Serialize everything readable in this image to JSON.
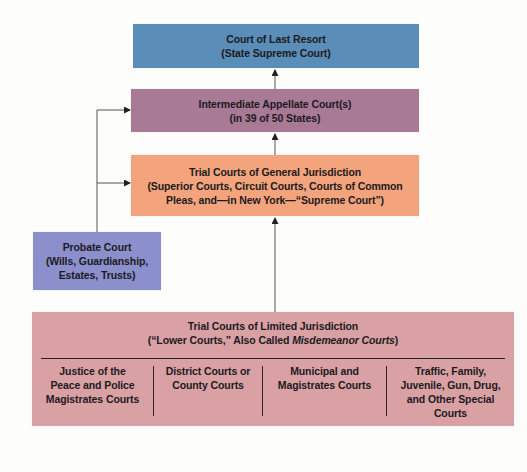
{
  "diagram": {
    "supreme": {
      "title": "Court of Last Resort",
      "subtitle": "(State Supreme Court)",
      "color": "#5b8db9"
    },
    "appellate": {
      "title": "Intermediate Appellate Court(s)",
      "subtitle": "(in 39 of 50 States)",
      "color": "#a97a95"
    },
    "general": {
      "title": "Trial Courts of General Jurisdiction",
      "line2": "(Superior Courts, Circuit Courts, Courts of Common",
      "line3": "Pleas, and—in New York—“Supreme Court”)",
      "color": "#f3a47c"
    },
    "probate": {
      "title": "Probate Court",
      "line2": "(Wills, Guardianship,",
      "line3": "Estates, Trusts)",
      "color": "#8b90cc"
    },
    "limited": {
      "title": "Trial Courts of Limited Jurisdiction",
      "subtitle_prefix": "(“Lower Courts,” Also Called ",
      "subtitle_italic": "Misdemeanor Courts",
      "subtitle_suffix": ")",
      "color": "#d9a1a3",
      "columns": [
        {
          "lines": [
            "Justice of the",
            "Peace and Police",
            "Magistrates Courts"
          ]
        },
        {
          "lines": [
            "District Courts or",
            "County Courts"
          ]
        },
        {
          "lines": [
            "Municipal and",
            "Magistrates Courts"
          ]
        },
        {
          "lines": [
            "Traffic, Family,",
            "Juvenile, Gun, Drug,",
            "and Other Special",
            "Courts"
          ]
        }
      ]
    },
    "edges": [
      {
        "from": "limited",
        "to": "general"
      },
      {
        "from": "general",
        "to": "appellate"
      },
      {
        "from": "appellate",
        "to": "supreme"
      },
      {
        "from": "probate",
        "to": "general"
      },
      {
        "from": "probate",
        "to": "appellate"
      }
    ]
  }
}
